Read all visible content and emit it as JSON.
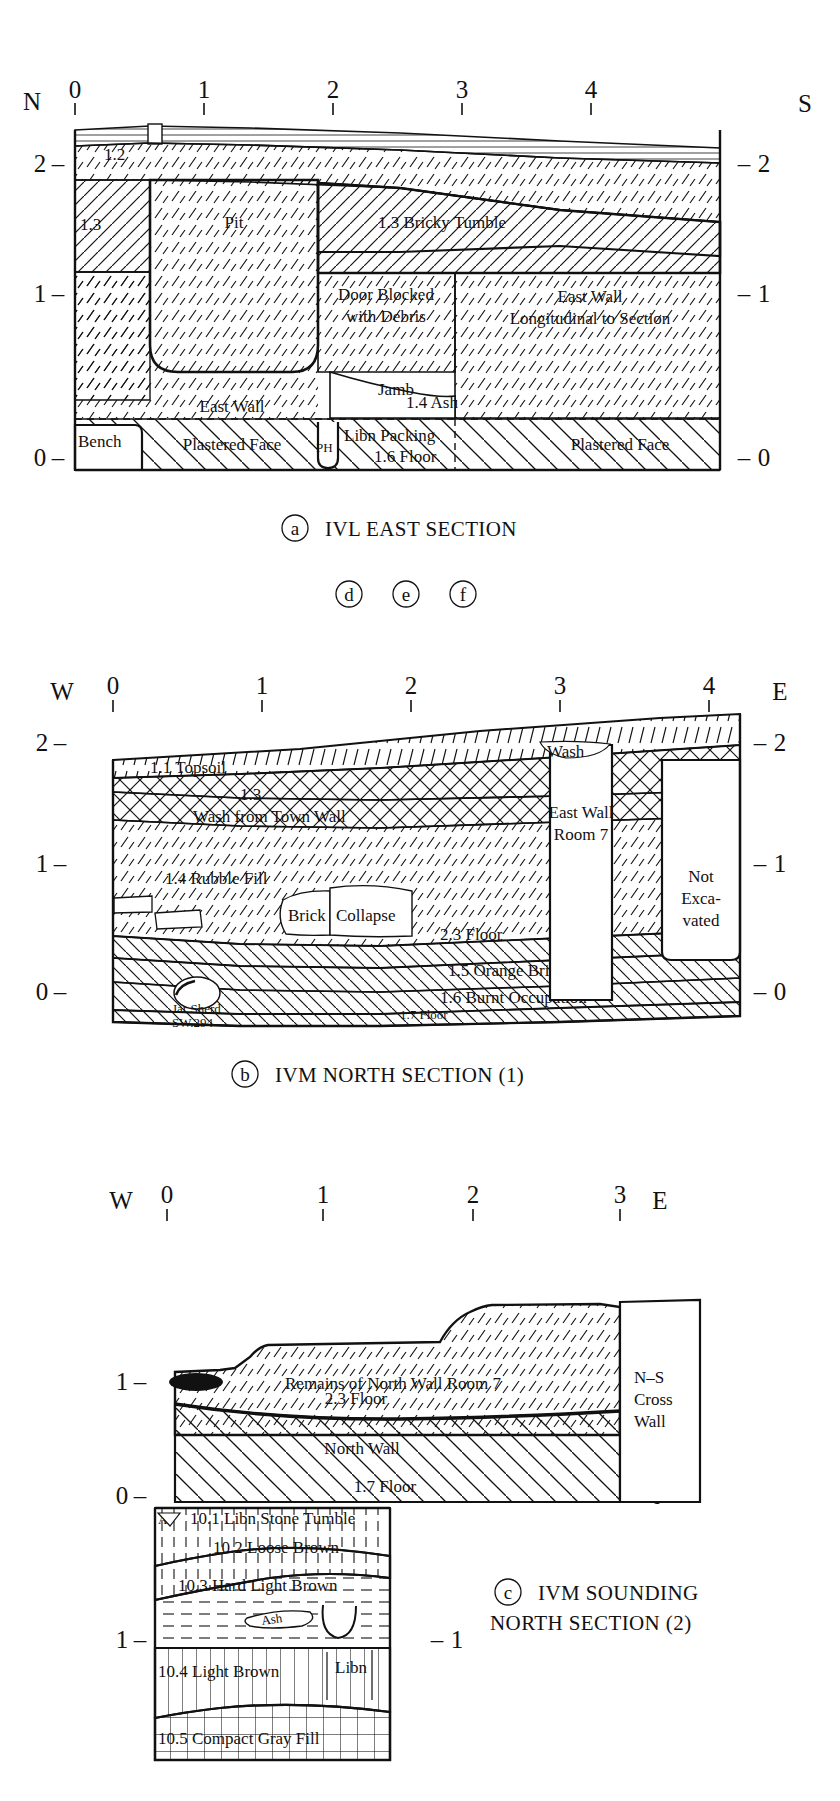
{
  "figure": {
    "line_color": "#111111",
    "background": "#ffffff"
  },
  "markers": {
    "d": "d",
    "e": "e",
    "f": "f"
  },
  "sections": [
    {
      "id": "a",
      "caption_letter": "a",
      "caption": "IVL EAST SECTION",
      "left_compass": "N",
      "right_compass": "S",
      "scale_ticks": [
        "0",
        "1",
        "2",
        "3",
        "4"
      ],
      "left_levels": [
        "2",
        "1",
        "0"
      ],
      "right_levels": [
        "2",
        "1",
        "0"
      ],
      "level_dash": "–",
      "labels": [
        {
          "name": "unit-1-2",
          "text": "1.2"
        },
        {
          "name": "unit-1-3-left",
          "text": "1.3"
        },
        {
          "name": "pit",
          "text": "Pit"
        },
        {
          "name": "bricky-tumble",
          "text": "1.3 Bricky Tumble"
        },
        {
          "name": "door-blocked-1",
          "text": "Door Blocked"
        },
        {
          "name": "door-blocked-2",
          "text": "with Debris"
        },
        {
          "name": "east-wall-longitudinal-1",
          "text": "East Wall"
        },
        {
          "name": "east-wall-longitudinal-2",
          "text": "Longitudinal to Section"
        },
        {
          "name": "east-wall",
          "text": "East Wall"
        },
        {
          "name": "jamb",
          "text": "Jamb"
        },
        {
          "name": "ash",
          "text": "1.4 Ash"
        },
        {
          "name": "bench",
          "text": "Bench"
        },
        {
          "name": "plastered-face-left",
          "text": "Plastered Face"
        },
        {
          "name": "post-hole",
          "text": "PH"
        },
        {
          "name": "libn-packing",
          "text": "Libn Packing"
        },
        {
          "name": "floor-1-6",
          "text": "1.6 Floor"
        },
        {
          "name": "plastered-face-right",
          "text": "Plastered Face"
        }
      ]
    },
    {
      "id": "b",
      "caption_letter": "b",
      "caption": "IVM NORTH SECTION (1)",
      "left_compass": "W",
      "right_compass": "E",
      "scale_ticks": [
        "0",
        "1",
        "2",
        "3",
        "4"
      ],
      "left_levels": [
        "2",
        "1",
        "0"
      ],
      "right_levels": [
        "2",
        "1",
        "0"
      ],
      "level_dash": "–",
      "labels": [
        {
          "name": "topsoil",
          "text": "1.1 Topsoil"
        },
        {
          "name": "unit-1-3",
          "text": "1.3"
        },
        {
          "name": "wash-from-town-wall",
          "text": "Wash from Town Wall"
        },
        {
          "name": "wash",
          "text": "Wash"
        },
        {
          "name": "rubble-fill",
          "text": "1.4 Rubble Fill"
        },
        {
          "name": "brick",
          "text": "Brick"
        },
        {
          "name": "collapse",
          "text": "Collapse"
        },
        {
          "name": "floor-2-3",
          "text": "2.3 Floor"
        },
        {
          "name": "orange-bricky",
          "text": "1.5 Orange Bricky"
        },
        {
          "name": "burnt-occupation",
          "text": "1.6 Burnt Occupation"
        },
        {
          "name": "floor-1-7",
          "text": "1.7 Floor"
        },
        {
          "name": "jar-sherd",
          "text": "Jar Sherd"
        },
        {
          "name": "jar-sherd-number",
          "text": "SW.294"
        },
        {
          "name": "east-wall-room-7-1",
          "text": "East Wall"
        },
        {
          "name": "east-wall-room-7-2",
          "text": "Room 7"
        },
        {
          "name": "not-excavated-1",
          "text": "Not"
        },
        {
          "name": "not-excavated-2",
          "text": "Exca-"
        },
        {
          "name": "not-excavated-3",
          "text": "vated"
        }
      ]
    },
    {
      "id": "c",
      "caption_letter": "c",
      "caption_line1": "IVM SOUNDING",
      "caption_line2": "NORTH SECTION (2)",
      "left_compass": "W",
      "right_compass": "E",
      "scale_ticks": [
        "0",
        "1",
        "2",
        "3"
      ],
      "left_levels": [
        "1",
        "0",
        "1"
      ],
      "right_levels": [
        "1",
        "0",
        "1"
      ],
      "level_dash": "–",
      "labels": [
        {
          "name": "remains-north-wall",
          "text": "Remains of North Wall Room 7"
        },
        {
          "name": "floor-2-3",
          "text": "2.3 Floor"
        },
        {
          "name": "north-wall",
          "text": "North Wall"
        },
        {
          "name": "floor-1-7",
          "text": "1.7 Floor"
        },
        {
          "name": "ns-cross-wall-1",
          "text": "N–S"
        },
        {
          "name": "ns-cross-wall-2",
          "text": "Cross"
        },
        {
          "name": "ns-cross-wall-3",
          "text": "Wall"
        },
        {
          "name": "libn-stone-tumble",
          "text": "10.1 Libn Stone Tumble"
        },
        {
          "name": "loose-brown",
          "text": "10.2 Loose Brown"
        },
        {
          "name": "hard-light-brown",
          "text": "10.3 Hard Light Brown"
        },
        {
          "name": "ash",
          "text": "Ash"
        },
        {
          "name": "light-brown",
          "text": "10.4 Light Brown"
        },
        {
          "name": "libn",
          "text": "Libn"
        },
        {
          "name": "compact-gray-fill",
          "text": "10.5 Compact Gray Fill"
        },
        {
          "name": "marker-a",
          "text": "A"
        }
      ]
    }
  ]
}
